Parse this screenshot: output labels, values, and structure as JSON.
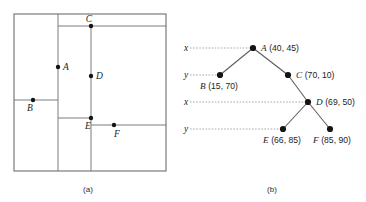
{
  "figure": {
    "panels": [
      {
        "id": "a",
        "caption": "(a)",
        "description": "space partition"
      },
      {
        "id": "b",
        "caption": "(b)",
        "description": "kd-tree"
      }
    ]
  },
  "partition": {
    "points": [
      {
        "name": "A",
        "x": 58,
        "y": 67,
        "label_dx": 5,
        "label_dy": 3
      },
      {
        "name": "B",
        "x": 33,
        "y": 100,
        "label_dx": -3,
        "label_dy": 11
      },
      {
        "name": "C",
        "x": 91,
        "y": 26,
        "label_dx": -2,
        "label_dy": -4
      },
      {
        "name": "D",
        "x": 91,
        "y": 76,
        "label_dx": 5,
        "label_dy": 3
      },
      {
        "name": "E",
        "x": 91,
        "y": 118,
        "label_dx": -3,
        "label_dy": 11
      },
      {
        "name": "F",
        "x": 114,
        "y": 125,
        "label_dx": 0,
        "label_dy": 12
      }
    ],
    "frame": {
      "x": 14,
      "y": 14,
      "width": 152,
      "height": 157
    },
    "splits": [
      {
        "of": "A",
        "orientation": "vertical",
        "x": 58,
        "y1": 14,
        "y2": 171
      },
      {
        "of": "B",
        "orientation": "horizontal",
        "y": 100,
        "x1": 14,
        "x2": 58
      },
      {
        "of": "C",
        "orientation": "horizontal",
        "y": 26,
        "x1": 58,
        "x2": 166
      },
      {
        "of": "D",
        "orientation": "vertical",
        "x": 91,
        "y1": 26,
        "y2": 171
      },
      {
        "of": "E",
        "orientation": "horizontal",
        "y": 118,
        "x1": 58,
        "x2": 91
      },
      {
        "of": "F",
        "orientation": "horizontal",
        "y": 125,
        "x1": 91,
        "x2": 166
      }
    ]
  },
  "tree": {
    "levels": [
      {
        "axis": "x",
        "y": 48,
        "leader_x1": 190,
        "leader_x2": 251
      },
      {
        "axis": "y",
        "y": 75,
        "leader_x1": 190,
        "leader_x2": 218
      },
      {
        "axis": "x",
        "y": 102,
        "leader_x1": 190,
        "leader_x2": 306
      },
      {
        "axis": "y",
        "y": 129,
        "leader_x1": 190,
        "leader_x2": 281
      }
    ],
    "nodes": [
      {
        "id": "A",
        "name": "A",
        "coords": "(40, 45)",
        "cx": 253,
        "cy": 48,
        "label_x": 261,
        "label_y": 51,
        "anchor": "start"
      },
      {
        "id": "B",
        "name": "B",
        "coords": "(15, 70)",
        "cx": 220,
        "cy": 75,
        "label_x": 200,
        "label_y": 89,
        "anchor": "start"
      },
      {
        "id": "C",
        "name": "C",
        "coords": "(70, 10)",
        "cx": 288,
        "cy": 75,
        "label_x": 296,
        "label_y": 78,
        "anchor": "start"
      },
      {
        "id": "D",
        "name": "D",
        "coords": "(69, 50)",
        "cx": 308,
        "cy": 102,
        "label_x": 316,
        "label_y": 105,
        "anchor": "start"
      },
      {
        "id": "E",
        "name": "E",
        "coords": "(66, 85)",
        "cx": 283,
        "cy": 129,
        "label_x": 263,
        "label_y": 143,
        "anchor": "start"
      },
      {
        "id": "F",
        "name": "F",
        "coords": "(85, 90)",
        "cx": 330,
        "cy": 129,
        "label_x": 313,
        "label_y": 143,
        "anchor": "start"
      }
    ],
    "edges": [
      {
        "from": "A",
        "to": "B"
      },
      {
        "from": "A",
        "to": "C"
      },
      {
        "from": "C",
        "to": "D"
      },
      {
        "from": "D",
        "to": "E"
      },
      {
        "from": "D",
        "to": "F"
      }
    ]
  },
  "colors": {
    "line": "#6e6e6e",
    "edge": "#5a5a5a",
    "leader": "#9a9a9a",
    "dot": "#141414",
    "text": "#1c1c1c",
    "background": "#ffffff"
  }
}
